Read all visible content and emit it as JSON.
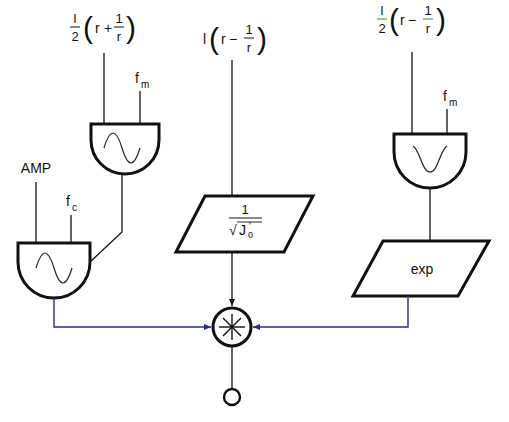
{
  "diagram": {
    "colors": {
      "stroke": "#111111",
      "signal_line": "#2a2a8a",
      "background": "#ffffff"
    },
    "inputs": {
      "top_left_expr": {
        "coef_num": "l",
        "coef_den": "2",
        "open": "(",
        "var": "r",
        "op": "+",
        "frac_num": "1",
        "frac_den": "r",
        "close": ")"
      },
      "middle_expr": {
        "coef": "l",
        "open": "(",
        "var": "r",
        "op": "−",
        "frac_num": "1",
        "frac_den": "r",
        "close": ")"
      },
      "top_right_expr": {
        "coef_num": "l",
        "coef_den": "2",
        "open": "(",
        "var": "r",
        "op": "−",
        "frac_num": "1",
        "frac_den": "r",
        "close": ")"
      },
      "fm_left": {
        "base": "f",
        "sub": "m"
      },
      "fm_right": {
        "base": "f",
        "sub": "m"
      },
      "amp": "AMP",
      "fc": {
        "base": "f",
        "sub": "c"
      }
    },
    "blocks": {
      "upper_left_oscillator": {
        "shape": "d-gate",
        "icon": "sine-wave-icon"
      },
      "lower_left_oscillator": {
        "shape": "d-gate",
        "icon": "sine-wave-icon"
      },
      "right_oscillator": {
        "shape": "d-gate",
        "icon": "gaussian-dip-icon"
      },
      "middle_scaler": {
        "shape": "parallelogram",
        "num": "1",
        "den_sqrt": "√",
        "den_var": "J",
        "den_sub": "0",
        "den_prime": "′"
      },
      "right_function": {
        "shape": "parallelogram",
        "label": "exp"
      },
      "multiplier": {
        "shape": "circle",
        "symbol": "✱"
      },
      "output": {
        "shape": "small-circle"
      }
    }
  }
}
